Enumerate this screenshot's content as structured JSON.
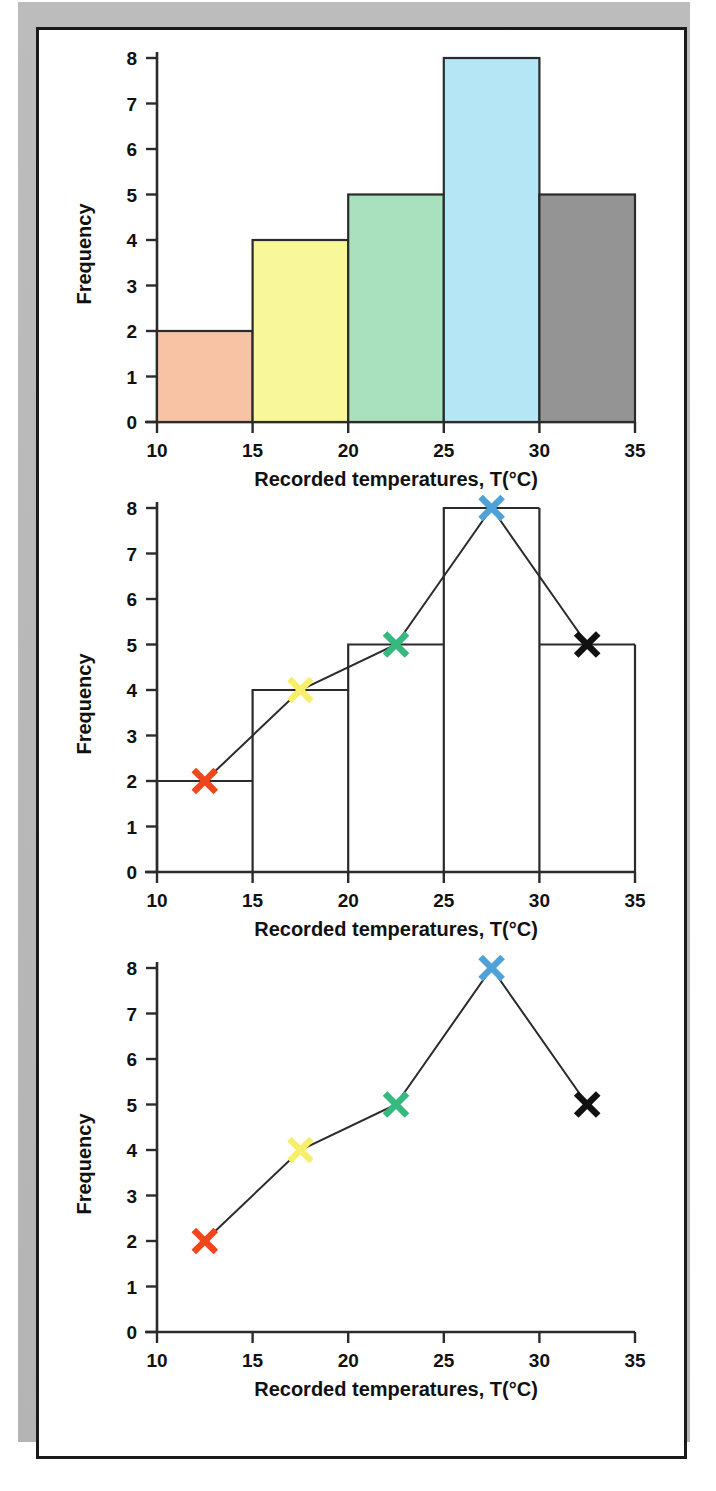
{
  "page": {
    "background_color": "#ffffff",
    "frame_color": "#b9b9b9",
    "sheet_border_color": "#1a1a1a"
  },
  "axis": {
    "x_title": "Recorded temperatures, T(°C)",
    "y_title": "Frequency",
    "x_ticks": [
      "10",
      "15",
      "20",
      "25",
      "30",
      "35"
    ],
    "y_ticks": [
      "0",
      "1",
      "2",
      "3",
      "4",
      "5",
      "6",
      "7",
      "8"
    ]
  },
  "chart_data": [
    {
      "type": "bar",
      "title": "",
      "xlabel": "Recorded temperatures, T(°C)",
      "ylabel": "Frequency",
      "xlim": [
        10,
        35
      ],
      "ylim": [
        0,
        8
      ],
      "bin_width": 5,
      "bin_edges": [
        10,
        15,
        20,
        25,
        30,
        35
      ],
      "categories": [
        "10-15",
        "15-20",
        "20-25",
        "25-30",
        "30-35"
      ],
      "values": [
        2,
        4,
        5,
        8,
        5
      ],
      "bar_colors": [
        "#f7c3a4",
        "#f8f79a",
        "#a9e0bd",
        "#b5e6f5",
        "#949494"
      ],
      "bar_edge_color": "#2b2b2b",
      "grid": false,
      "legend": "none"
    },
    {
      "type": "line",
      "title": "",
      "xlabel": "Recorded temperatures, T(°C)",
      "ylabel": "Frequency",
      "xlim": [
        10,
        35
      ],
      "ylim": [
        0,
        8
      ],
      "overlay": "histogram-outline",
      "bin_edges": [
        10,
        15,
        20,
        25,
        30,
        35
      ],
      "bin_values": [
        2,
        4,
        5,
        8,
        5
      ],
      "x": [
        12.5,
        17.5,
        22.5,
        27.5,
        32.5
      ],
      "values": [
        2,
        4,
        5,
        8,
        5
      ],
      "marker": "x",
      "marker_colors": [
        "#f0461c",
        "#f7ef6a",
        "#35b97e",
        "#4fa2d8",
        "#111111"
      ],
      "line_color": "#2b2b2b",
      "grid": false,
      "legend": "none"
    },
    {
      "type": "line",
      "title": "",
      "xlabel": "Recorded temperatures, T(°C)",
      "ylabel": "Frequency",
      "xlim": [
        10,
        35
      ],
      "ylim": [
        0,
        8
      ],
      "overlay": "none",
      "x": [
        12.5,
        17.5,
        22.5,
        27.5,
        32.5
      ],
      "values": [
        2,
        4,
        5,
        8,
        5
      ],
      "marker": "x",
      "marker_colors": [
        "#f0461c",
        "#f7ef6a",
        "#35b97e",
        "#4fa2d8",
        "#111111"
      ],
      "line_color": "#2b2b2b",
      "grid": false,
      "legend": "none"
    }
  ]
}
